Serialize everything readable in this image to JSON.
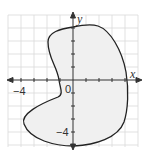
{
  "graph": {
    "x_axis_label": "x",
    "y_axis_label": "y",
    "origin_label": "0",
    "x_tick_label": "−4",
    "y_tick_label": "−4",
    "grid_color": "#d9d9d9",
    "axis_color": "#333333",
    "fill_color": "#f0f0f0",
    "curve_color": "#222222",
    "region": "closed curved region (kidney shape) enclosing part of the coordinate plane"
  }
}
